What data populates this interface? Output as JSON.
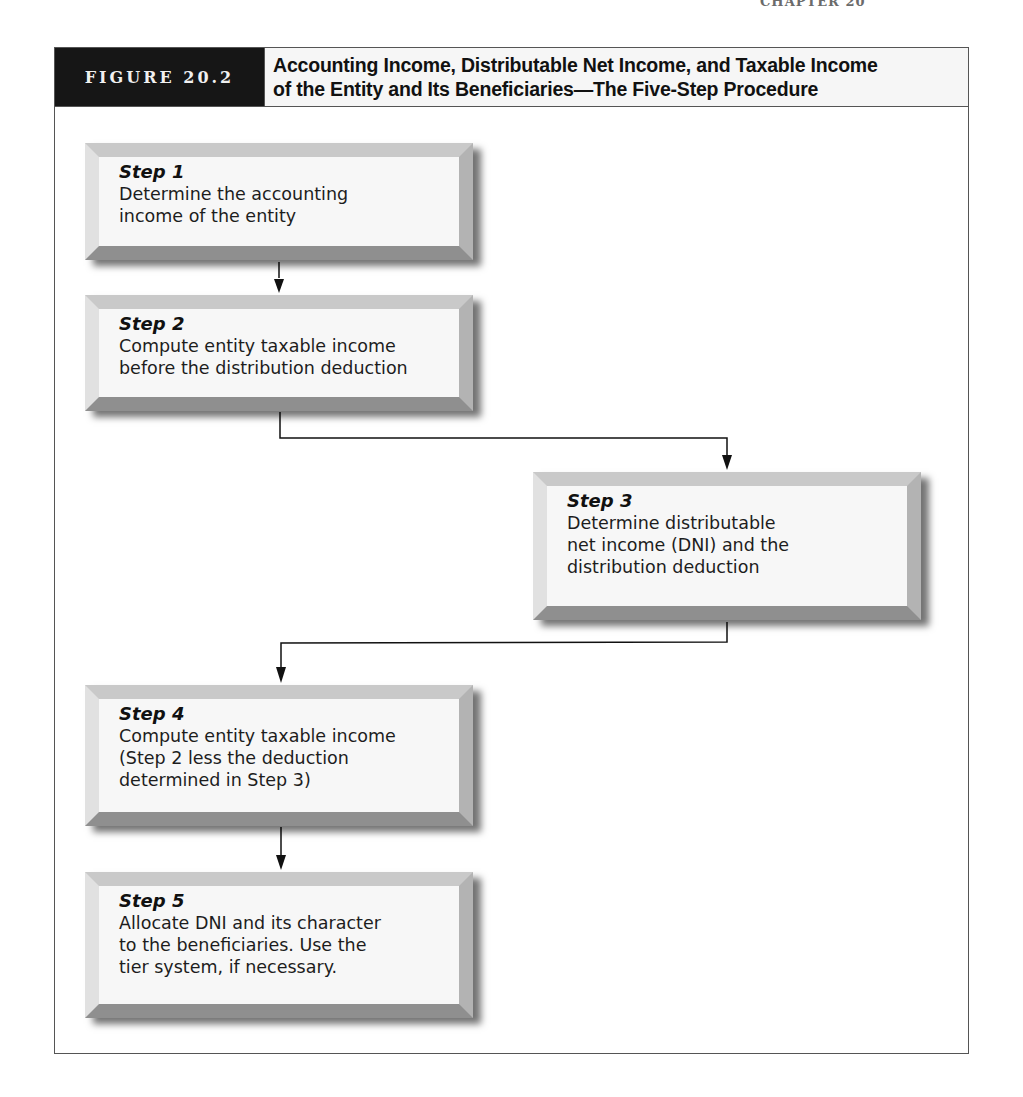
{
  "page_header": {
    "text": "CHAPTER 20"
  },
  "figure": {
    "label": "FIGURE 20.2",
    "title_line1": "Accounting Income, Distributable Net Income, and Taxable Income",
    "title_line2": "of the Entity and Its Beneficiaries—The Five-Step Procedure"
  },
  "steps": [
    {
      "title": "Step 1",
      "lines": [
        "Determine the accounting",
        "income of the entity"
      ]
    },
    {
      "title": "Step 2",
      "lines": [
        "Compute entity taxable income",
        "before the distribution deduction"
      ]
    },
    {
      "title": "Step 3",
      "lines": [
        "Determine distributable",
        "net income (DNI) and the",
        "distribution deduction"
      ]
    },
    {
      "title": "Step 4",
      "lines": [
        "Compute entity taxable income",
        "(Step 2 less the deduction",
        "determined in Step 3)"
      ]
    },
    {
      "title": "Step 5",
      "lines": [
        "Allocate DNI and its character",
        "to the beneficiaries. Use the",
        "tier system, if necessary."
      ]
    }
  ],
  "colors": {
    "label_bg": "#161616",
    "title_bg": "#f6f6f6",
    "frame": "#555555",
    "box_face": "#f7f7f7",
    "arrow": "#111111"
  }
}
